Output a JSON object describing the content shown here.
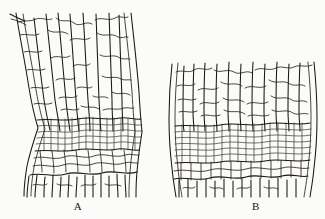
{
  "plate": {
    "background_color": "#fbfbf9",
    "ink_color": "#1a1714",
    "description": "Two line-drawing illustrations of plant tissue in longitudinal section, each showing elongated axial cells above and below a transverse band of small isodiametric cells.",
    "figures": [
      {
        "id": "A",
        "caption": "A",
        "region": "left",
        "outline": "waisted cylinder, narrower at the mid-height band",
        "bounds": {
          "x": 14,
          "y": 12,
          "width": 136,
          "height": 185
        },
        "bands": [
          {
            "name": "upper-elongated-cells",
            "cell_shape": "long rectangular",
            "rows": 4
          },
          {
            "name": "central-small-cell-band",
            "cell_shape": "small isodiametric",
            "rows": 6
          },
          {
            "name": "lower-elongated-cells",
            "cell_shape": "long rectangular",
            "rows": 4
          }
        ]
      },
      {
        "id": "B",
        "caption": "B",
        "region": "right",
        "outline": "slightly barrel-shaped cylinder",
        "bounds": {
          "x": 168,
          "y": 60,
          "width": 150,
          "height": 137
        },
        "bands": [
          {
            "name": "upper-elongated-cells",
            "cell_shape": "long rectangular",
            "rows": 3
          },
          {
            "name": "central-small-cell-band",
            "cell_shape": "small isodiametric",
            "rows": 7
          },
          {
            "name": "lower-elongated-cells",
            "cell_shape": "long rectangular",
            "rows": 3
          }
        ]
      }
    ]
  }
}
